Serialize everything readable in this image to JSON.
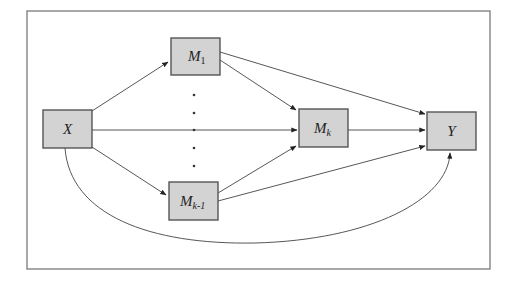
{
  "diagram": {
    "type": "mediation-path-diagram",
    "nodes": [
      {
        "id": "X",
        "label": "X",
        "subscript": ""
      },
      {
        "id": "M1",
        "label": "M",
        "subscript": "1"
      },
      {
        "id": "Mk1",
        "label": "M",
        "subscript": "k-1"
      },
      {
        "id": "Mk",
        "label": "M",
        "subscript": "k"
      },
      {
        "id": "Y",
        "label": "Y",
        "subscript": ""
      }
    ],
    "edges": [
      {
        "from": "X",
        "to": "M1"
      },
      {
        "from": "X",
        "to": "Mk"
      },
      {
        "from": "X",
        "to": "Mk1"
      },
      {
        "from": "X",
        "to": "Y",
        "style": "curved"
      },
      {
        "from": "M1",
        "to": "Mk"
      },
      {
        "from": "M1",
        "to": "Y"
      },
      {
        "from": "Mk1",
        "to": "Mk"
      },
      {
        "from": "Mk1",
        "to": "Y"
      },
      {
        "from": "Mk",
        "to": "Y"
      }
    ],
    "ellipsis": "vertical dots between M1 and Mk-1",
    "colors": {
      "node_fill": "#d3d3d3",
      "node_border": "#555555",
      "edge": "#444444",
      "frame": "#7a7a7a"
    }
  }
}
